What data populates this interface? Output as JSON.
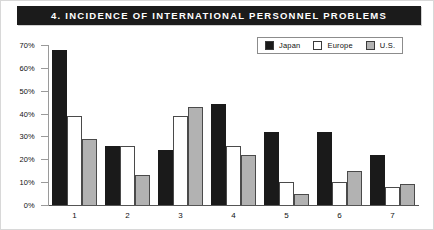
{
  "figure": {
    "title": "4. INCIDENCE OF INTERNATIONAL PERSONNEL PROBLEMS"
  },
  "colors": {
    "japan": "#1a1a1a",
    "europe": "#ffffff",
    "us": "#b2b2b2",
    "title_background": "#1b1b1b",
    "title_text": "#ffffff",
    "axis": "#9a9a9a"
  },
  "chart_data": {
    "type": "bar",
    "title": "4. INCIDENCE OF INTERNATIONAL PERSONNEL PROBLEMS",
    "xlabel": "",
    "ylabel": "",
    "categories": [
      "1",
      "2",
      "3",
      "4",
      "5",
      "6",
      "7"
    ],
    "series": [
      {
        "name": "Japan",
        "values": [
          68,
          26,
          24,
          44,
          32,
          32,
          22
        ]
      },
      {
        "name": "Europe",
        "values": [
          39,
          26,
          39,
          26,
          10,
          10,
          8
        ]
      },
      {
        "name": "U.S.",
        "values": [
          29,
          13,
          43,
          22,
          5,
          15,
          9
        ]
      }
    ],
    "ylim": [
      0,
      70
    ],
    "yticks": [
      0,
      10,
      20,
      30,
      40,
      50,
      60,
      70
    ],
    "ytick_labels": [
      "0%",
      "10%",
      "20%",
      "30%",
      "40%",
      "50%",
      "60%",
      "70%"
    ],
    "grid": false,
    "legend_position": "top-right"
  },
  "legend": {
    "items": [
      {
        "label": "Japan",
        "style": "filled-black"
      },
      {
        "label": "Europe",
        "style": "outline-white"
      },
      {
        "label": "U.S.",
        "style": "filled-gray"
      }
    ]
  }
}
